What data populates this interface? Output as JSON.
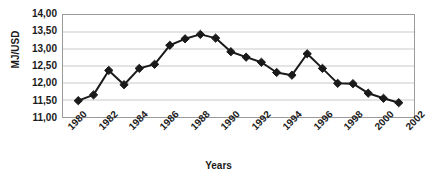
{
  "chart_data": {
    "type": "line",
    "title": "",
    "xlabel": "Years",
    "ylabel": "MJ/USD",
    "x": [
      1981,
      1982,
      1983,
      1984,
      1985,
      1986,
      1987,
      1988,
      1989,
      1990,
      1991,
      1992,
      1993,
      1994,
      1995,
      1996,
      1997,
      1998,
      1999,
      2000,
      2001,
      2002
    ],
    "values": [
      11.48,
      11.65,
      12.37,
      11.95,
      12.43,
      12.55,
      13.11,
      13.3,
      13.43,
      13.32,
      12.92,
      12.76,
      12.61,
      12.31,
      12.23,
      12.86,
      12.43,
      11.99,
      11.98,
      11.7,
      11.55,
      11.42
    ],
    "series": [
      {
        "name": "MJ/USD",
        "values": [
          11.48,
          11.65,
          12.37,
          11.95,
          12.43,
          12.55,
          13.11,
          13.3,
          13.43,
          13.32,
          12.92,
          12.76,
          12.61,
          12.31,
          12.23,
          12.86,
          12.43,
          11.99,
          11.98,
          11.7,
          11.55,
          11.42
        ]
      }
    ],
    "ylim": [
      11.0,
      14.0
    ],
    "ytick_values": [
      14.0,
      13.5,
      13.0,
      12.5,
      12.0,
      11.5,
      11.0
    ],
    "ytick_labels": [
      "14,00",
      "13,50",
      "13,00",
      "12,50",
      "12,00",
      "11,50",
      "11,00"
    ],
    "xlim": [
      1980,
      2003
    ],
    "xtick_values": [
      1980,
      1982,
      1984,
      1986,
      1988,
      1990,
      1992,
      1994,
      1996,
      1998,
      2000,
      2002
    ],
    "xtick_labels": [
      "1980",
      "1982",
      "1984",
      "1986",
      "1988",
      "1990",
      "1992",
      "1994",
      "1996",
      "1998",
      "2000",
      "2002"
    ],
    "xtick_minor_values": [
      1981,
      1983,
      1985,
      1987,
      1989,
      1991,
      1993,
      1995,
      1997,
      1999,
      2001,
      2003
    ],
    "grid": {
      "horizontal": true,
      "vertical": false
    },
    "legend": {
      "visible": false,
      "position": "none"
    },
    "marker": "diamond",
    "line_color": "#1a1a1a",
    "marker_color": "#1a1a1a",
    "grid_color": "#c9c9c9",
    "frame_color": "#9a9a9a",
    "background_color": "#ffffff"
  }
}
